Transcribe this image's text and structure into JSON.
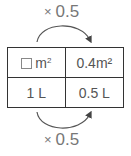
{
  "diagram": {
    "top_operation": {
      "symbol": "×",
      "value": "0.5"
    },
    "bottom_operation": {
      "symbol": "×",
      "value": "0.5"
    },
    "table": {
      "rows": [
        {
          "left": {
            "blank": true,
            "unit": "m²"
          },
          "right": "0.4m²"
        },
        {
          "left": {
            "text": "1 L"
          },
          "right": "0.5 L"
        }
      ]
    },
    "colors": {
      "border": "#333333",
      "text": "#555555",
      "label": "#777777"
    }
  }
}
